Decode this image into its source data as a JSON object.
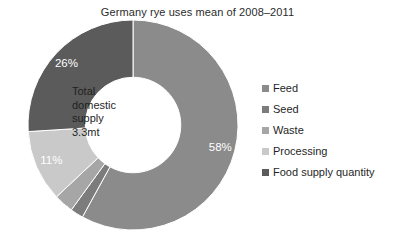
{
  "chart_data": {
    "type": "pie",
    "variant": "donut",
    "title": "Germany rye uses mean of 2008–2011",
    "xlabel": "",
    "ylabel": "",
    "grid": false,
    "legend_position": "right",
    "start_angle_deg": 0,
    "direction": "clockwise",
    "inner_radius_ratio": 0.455,
    "categories": [
      "Feed",
      "Seed",
      "Waste",
      "Processing",
      "Food supply quantity"
    ],
    "values": [
      58,
      2,
      3,
      11,
      26
    ],
    "value_unit": "%",
    "data_labels": [
      "58%",
      "2%",
      "3%",
      "11%",
      "26%"
    ],
    "colors": [
      "#8b8b8b",
      "#7c7c7c",
      "#a6a6a6",
      "#c9c9c9",
      "#5b5b5b"
    ],
    "slices": [
      {
        "label": "Feed",
        "value": 58,
        "display": "58%",
        "color": "#8b8b8b"
      },
      {
        "label": "Seed",
        "value": 2,
        "display": "2%",
        "color": "#7c7c7c"
      },
      {
        "label": "Waste",
        "value": 3,
        "display": "3%",
        "color": "#a6a6a6"
      },
      {
        "label": "Processing",
        "value": 11,
        "display": "11%",
        "color": "#c9c9c9"
      },
      {
        "label": "Food supply quantity",
        "value": 26,
        "display": "26%",
        "color": "#5b5b5b"
      }
    ],
    "center_annotation": {
      "lines": [
        "Total",
        "domestic",
        "supply",
        "3.3mt"
      ],
      "total_value": "3.3mt"
    }
  },
  "legend": {
    "items": [
      {
        "label": "Feed",
        "color": "#8b8b8b"
      },
      {
        "label": "Seed",
        "color": "#7c7c7c"
      },
      {
        "label": "Waste",
        "color": "#a6a6a6"
      },
      {
        "label": "Processing",
        "color": "#c9c9c9"
      },
      {
        "label": "Food supply quantity",
        "color": "#5b5b5b"
      }
    ]
  },
  "center": {
    "line1": "Total",
    "line2": "domestic",
    "line3": "supply",
    "line4": "3.3mt"
  },
  "labels": {
    "feed": "58%",
    "seed": "2%",
    "waste": "3%",
    "processing": "11%",
    "food_supply_quantity": "26%"
  },
  "background_color": "#ffffff"
}
